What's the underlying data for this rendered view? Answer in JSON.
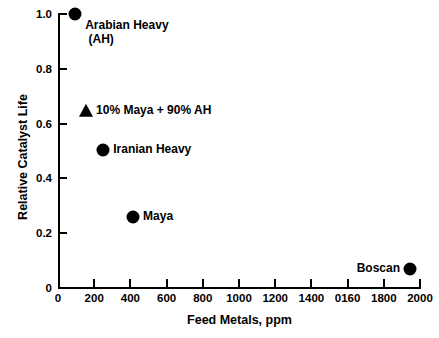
{
  "chart_data": {
    "type": "scatter",
    "title": "",
    "xlabel": "Feed Metals, ppm",
    "ylabel": "Relative Catalyst Life",
    "xlim": [
      0,
      2000
    ],
    "ylim": [
      0,
      1.0
    ],
    "grid": false,
    "legend_position": "none",
    "xticks": [
      0,
      200,
      400,
      600,
      800,
      1000,
      1200,
      1400,
      1600,
      1800,
      2000
    ],
    "xtick_labels": [
      "0",
      "200",
      "400",
      "600",
      "800",
      "1000",
      "1200",
      "1400",
      "0160",
      "1800",
      "2000"
    ],
    "yticks": [
      0,
      0.2,
      0.4,
      0.6,
      0.8,
      1.0
    ],
    "ytick_labels": [
      "0",
      "0.2",
      "0.4",
      "0.6",
      "0.8",
      "1.0"
    ],
    "points": [
      {
        "name": "arabian-heavy",
        "label": "Arabian Heavy\n (AH)",
        "x": 95,
        "y": 1.0,
        "marker": "circle",
        "label_side": "right"
      },
      {
        "name": "maya-ah-blend",
        "label": "10% Maya + 90% AH",
        "x": 155,
        "y": 0.645,
        "marker": "triangle",
        "label_side": "right"
      },
      {
        "name": "iranian-heavy",
        "label": "Iranian Heavy",
        "x": 250,
        "y": 0.505,
        "marker": "circle",
        "label_side": "right"
      },
      {
        "name": "maya",
        "label": "Maya",
        "x": 415,
        "y": 0.26,
        "marker": "circle",
        "label_side": "right"
      },
      {
        "name": "boscan",
        "label": "Boscan",
        "x": 1945,
        "y": 0.07,
        "marker": "circle",
        "label_side": "left"
      }
    ]
  },
  "colors": {
    "background": "#ffffff",
    "foreground": "#000000",
    "marker": "#000000"
  }
}
